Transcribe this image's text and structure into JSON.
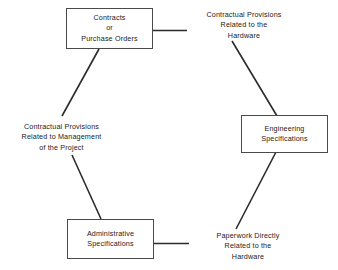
{
  "diagram": {
    "type": "cycle-diagram",
    "title": "",
    "background_color": "#ffffff",
    "line_color": "#2b2b2b",
    "text_color": "#222222",
    "nodes": [
      {
        "id": "contracts",
        "lines": [
          "Contracts",
          "or",
          "Purchase Orders"
        ]
      },
      {
        "id": "engineering",
        "lines": [
          "Engineering",
          "Specifications"
        ]
      },
      {
        "id": "administrative",
        "lines": [
          "Administrative",
          "Specifications"
        ]
      }
    ],
    "edge_labels": [
      {
        "id": "hardware-contractual",
        "from": "contracts",
        "to": "engineering",
        "lines": [
          "Contractual Provisions",
          "Related to the",
          "Hardware"
        ]
      },
      {
        "id": "paperwork",
        "from": "engineering",
        "to": "administrative",
        "lines": [
          "Paperwork Directly",
          "Related to the",
          "Hardware"
        ]
      },
      {
        "id": "management",
        "from": "administrative",
        "to": "contracts",
        "lines": [
          "Contractual Provisions",
          "Related to Management",
          "of the Project"
        ]
      }
    ]
  }
}
